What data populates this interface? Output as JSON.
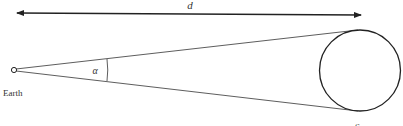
{
  "diagram": {
    "labels": {
      "distance": "d",
      "angle": "α",
      "earth": "Earth",
      "sun": "Sun"
    },
    "colors": {
      "stroke": "#222222",
      "text": "#333333",
      "background": "#ffffff"
    }
  }
}
